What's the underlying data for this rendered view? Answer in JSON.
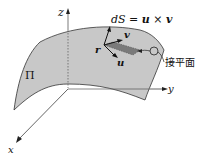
{
  "diagram": {
    "axes": {
      "x_label": "x",
      "y_label": "y",
      "z_label": "z"
    },
    "surface_label": "Π",
    "equation": {
      "lhs": "dS",
      "equals": "=",
      "u": "u",
      "times": "×",
      "v": "v"
    },
    "vectors": {
      "r": "r",
      "u": "u",
      "v": "v"
    },
    "tangent_plane_label": "接平面",
    "colors": {
      "surface_fill": "#c8c8c8",
      "patch_fill": "#7a7a7a",
      "line": "#222222",
      "background": "#ffffff"
    }
  }
}
